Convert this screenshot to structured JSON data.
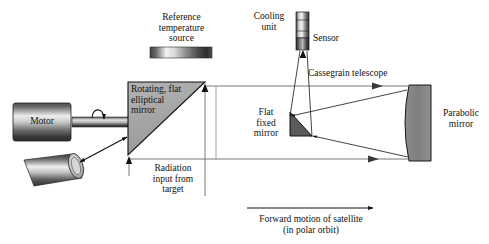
{
  "figure": {
    "background": "#ffffff",
    "ink": "#111111"
  },
  "labels": {
    "reference_source": "Reference\ntemperature\nsource",
    "cooling_unit": "Cooling\nunit",
    "sensor": "Sensor",
    "cassegrain": "Cassegrain telescope",
    "rotating_mirror": "Rotating, flat\nelliptical\nmirror",
    "motor": "Motor",
    "radiation_input": "Radiation\ninput from\ntarget",
    "flat_fixed_mirror": "Flat\nfixed\nmirror",
    "parabolic_mirror": "Parabolic\nmirror",
    "forward_motion": "Forward motion of satellite\n(in polar orbit)"
  },
  "components": [
    {
      "name": "reference-temperature-source-bar",
      "shape": "gradient-bar",
      "x": 150,
      "y": 47,
      "w": 62,
      "h": 11
    },
    {
      "name": "motor-cylinder",
      "shape": "cylinder",
      "x": 13,
      "y": 103,
      "w": 60,
      "h": 38
    },
    {
      "name": "motor-shaft",
      "shape": "shaft",
      "x": 73,
      "y": 117,
      "w": 55,
      "h": 11
    },
    {
      "name": "scan-tube",
      "shape": "tilted-cylinder",
      "x": 20,
      "y": 155,
      "w": 62,
      "h": 32
    },
    {
      "name": "rotating-flat-elliptical-mirror",
      "shape": "right-triangle",
      "x": 128,
      "y": 82,
      "w": 77,
      "h": 73
    },
    {
      "name": "cooling-unit-body",
      "shape": "cylinder-vertical",
      "x": 296,
      "y": 12,
      "w": 13,
      "h": 25
    },
    {
      "name": "sensor-body",
      "shape": "cylinder-vertical-dark",
      "x": 296,
      "y": 37,
      "w": 13,
      "h": 13
    },
    {
      "name": "flat-fixed-mirror",
      "shape": "small-triangle",
      "x": 288,
      "y": 112,
      "w": 24,
      "h": 25
    },
    {
      "name": "parabolic-mirror",
      "shape": "concave-slab",
      "x": 405,
      "y": 85,
      "w": 26,
      "h": 76
    }
  ],
  "rays": [
    {
      "name": "upper-ray-to-parabolic",
      "from": [
        206,
        86
      ],
      "to": [
        410,
        86
      ],
      "arrow_at": [
        381,
        86
      ]
    },
    {
      "name": "lower-ray-to-parabolic",
      "from": [
        129,
        159
      ],
      "to": [
        410,
        159
      ],
      "arrow_at": [
        379,
        159
      ]
    },
    {
      "name": "parabolic-to-flat-upper",
      "from": [
        408,
        92
      ],
      "to": [
        292,
        118
      ],
      "arrow_at": [
        296,
        117
      ]
    },
    {
      "name": "parabolic-to-flat-lower",
      "from": [
        409,
        156
      ],
      "to": [
        310,
        134
      ],
      "arrow_at": [
        314,
        135
      ]
    },
    {
      "name": "flat-to-sensor-left",
      "from": [
        291,
        120
      ],
      "to": [
        301,
        50
      ]
    },
    {
      "name": "flat-to-sensor-right",
      "from": [
        311,
        135
      ],
      "to": [
        307,
        50
      ]
    },
    {
      "name": "sensor-arrow",
      "from": [
        303,
        62
      ],
      "to": [
        303,
        50
      ],
      "arrow_at": [
        303,
        50
      ]
    },
    {
      "name": "radiation-input-arrow",
      "from": [
        205,
        196
      ],
      "to": [
        205,
        84
      ],
      "arrow_at": [
        205,
        84
      ]
    },
    {
      "name": "radiation-input-vertical-right",
      "from": [
        215,
        86
      ],
      "to": [
        215,
        160
      ]
    },
    {
      "name": "mirror-bottom-arrow",
      "from": [
        129,
        176
      ],
      "to": [
        129,
        157
      ],
      "arrow_at": [
        129,
        157
      ]
    },
    {
      "name": "scan-double-arrow",
      "from": [
        80,
        163
      ],
      "to": [
        128,
        136
      ]
    },
    {
      "name": "shaft-rotation-arrow",
      "from": [
        95,
        112
      ],
      "to": [
        100,
        126
      ]
    },
    {
      "name": "forward-motion-arrow",
      "from": [
        247,
        208
      ],
      "to": [
        377,
        208
      ],
      "arrow_at": [
        377,
        208
      ]
    }
  ],
  "colors": {
    "mirror_fill": "#a8a8a8",
    "mirror_stroke": "#111111",
    "parabolic_fill": "#888888",
    "flat_mirror_fill": "#5a5a5a",
    "ray_stroke": "#5f5f5f",
    "metal_light": "#e8e8e8",
    "metal_dark": "#2a2a2a"
  }
}
